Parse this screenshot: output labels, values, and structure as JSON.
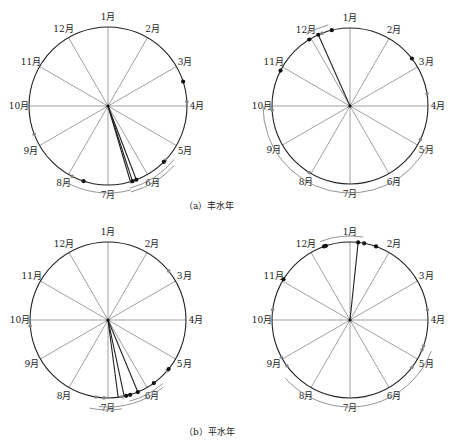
{
  "months": [
    "1月",
    "2月",
    "3月",
    "4月",
    "5月",
    "6月",
    "7月",
    "8月",
    "9月",
    "10月",
    "11月",
    "12月"
  ],
  "captions": {
    "a": "（a）丰水年",
    "b": "（b）平水年"
  },
  "colors": {
    "circle": "#222222",
    "spoke": "#777777",
    "arc": "#888888",
    "dot_black": "#111111",
    "dot_gray": "#888888"
  },
  "panels": [
    {
      "id": "a-left",
      "cx": 108,
      "cy": 106,
      "r": 79,
      "black_dots": [
        3.4,
        5.5,
        6.3,
        6.4,
        7.6
      ],
      "gray_dots": [
        3.9,
        5.45,
        6.45,
        7.9,
        9.3
      ],
      "vectors": [
        6.3,
        6.4,
        6.45
      ],
      "arcs": [
        {
          "from": 5.3,
          "to": 6.5,
          "offset": 6
        },
        {
          "from": 5.4,
          "to": 6.5,
          "offset": 10
        },
        {
          "from": 6.5,
          "to": 8.0,
          "offset": 8
        }
      ]
    },
    {
      "id": "a-right",
      "cx": 350,
      "cy": 106,
      "r": 78,
      "black_dots": [
        11.95,
        12.2,
        12.55,
        10.9,
        2.75
      ],
      "gray_dots": [
        12.3,
        3.7,
        4.85,
        8.05,
        9.9
      ],
      "vectors": [
        12.2
      ],
      "arcs": [
        {
          "from": 11.95,
          "to": 12.5,
          "offset": 6
        },
        {
          "from": 4.9,
          "to": 10.0,
          "offset": 9
        }
      ]
    },
    {
      "id": "b-left",
      "cx": 108,
      "cy": 320,
      "r": 78,
      "black_dots": [
        5.3,
        5.8,
        6.25,
        6.45,
        6.55
      ],
      "gray_dots": [
        2.7,
        6.65,
        7.1,
        7.3,
        9.85,
        5.35
      ],
      "vectors": [
        6.25,
        6.6,
        6.75
      ],
      "arcs": [
        {
          "from": 5.65,
          "to": 6.5,
          "offset": 6
        },
        {
          "from": 5.7,
          "to": 7.2,
          "offset": 9
        },
        {
          "from": 6.7,
          "to": 7.4,
          "offset": 12
        }
      ]
    },
    {
      "id": "b-right",
      "cx": 350,
      "cy": 320,
      "r": 78,
      "black_dots": [
        12.35,
        12.4,
        1.2,
        1.35,
        1.65,
        11.05
      ],
      "gray_dots": [
        3.75,
        4.65,
        4.75,
        5.25,
        8.8,
        9.05,
        10.25
      ],
      "vectors": [
        1.2
      ],
      "arcs": [
        {
          "from": 12.3,
          "to": 1.3,
          "offset": 6
        },
        {
          "from": 4.7,
          "to": 8.6,
          "offset": 9
        }
      ]
    }
  ]
}
